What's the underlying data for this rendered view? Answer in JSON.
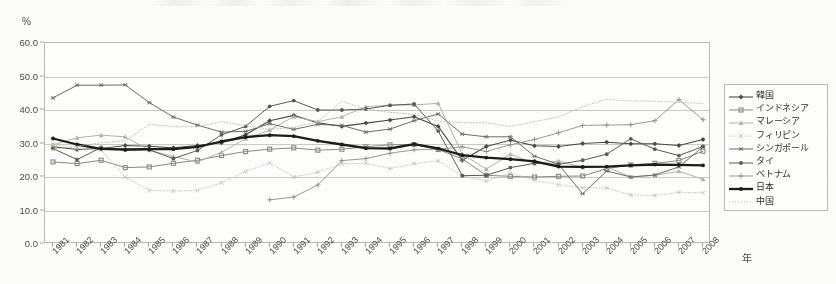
{
  "unit_label": "%",
  "xaxis_title": "年",
  "legend": {
    "items": [
      {
        "label": "韓国",
        "color": "#4a4a46",
        "marker": "diamond",
        "dash": "none",
        "width": 1.1
      },
      {
        "label": "インドネシア",
        "color": "#8a8a82",
        "marker": "square",
        "dash": "none",
        "width": 1.0
      },
      {
        "label": "マレーシア",
        "color": "#b4b4aa",
        "marker": "triangle",
        "dash": "none",
        "width": 1.0
      },
      {
        "label": "フィリピン",
        "color": "#c2c2b6",
        "marker": "x",
        "dash": "1,2",
        "width": 0.9
      },
      {
        "label": "シンガポール",
        "color": "#6f6f68",
        "marker": "asterisk",
        "dash": "none",
        "width": 1.0
      },
      {
        "label": "タイ",
        "color": "#5b5b55",
        "marker": "dot",
        "dash": "none",
        "width": 1.0
      },
      {
        "label": "ベトナム",
        "color": "#8f8f87",
        "marker": "plus",
        "dash": "none",
        "width": 0.9
      },
      {
        "label": "日本",
        "color": "#1c1c1a",
        "marker": "dot",
        "dash": "none",
        "width": 2.3
      },
      {
        "label": "中国",
        "color": "#b8b8ad",
        "marker": "none",
        "dash": "1,2",
        "width": 0.9
      }
    ]
  },
  "chart_data": {
    "type": "line",
    "title": "",
    "xlabel": "年",
    "ylabel": "%",
    "ylim": [
      0.0,
      60.0
    ],
    "yticks": [
      "0.0",
      "10.0",
      "20.0",
      "30.0",
      "40.0",
      "50.0",
      "60.0"
    ],
    "grid": true,
    "legend_position": "right",
    "x": [
      1981,
      1982,
      1983,
      1984,
      1985,
      1986,
      1987,
      1988,
      1989,
      1990,
      1991,
      1992,
      1993,
      1994,
      1995,
      1996,
      1997,
      1998,
      1999,
      2000,
      2001,
      2002,
      2003,
      2004,
      2005,
      2006,
      2007,
      2008
    ],
    "categories": [
      "1981",
      "1982",
      "1983",
      "1984",
      "1985",
      "1986",
      "1987",
      "1988",
      "1989",
      "1990",
      "1991",
      "1992",
      "1993",
      "1994",
      "1995",
      "1996",
      "1997",
      "1998",
      "1999",
      "2000",
      "2001",
      "2002",
      "2003",
      "2004",
      "2005",
      "2006",
      "2007",
      "2008"
    ],
    "series": [
      {
        "name": "韓国",
        "values": [
          29.0,
          28.2,
          28.5,
          29.4,
          29.2,
          28.7,
          29.4,
          30.2,
          32.6,
          36.8,
          38.4,
          36.2,
          35.1,
          36.1,
          37.0,
          38.0,
          35.1,
          25.0,
          29.1,
          31.0,
          29.3,
          29.1,
          30.0,
          30.4,
          29.9,
          29.9,
          29.4,
          31.2
        ]
      },
      {
        "name": "インドネシア",
        "values": [
          24.5,
          24.0,
          25.0,
          22.8,
          23.0,
          24.1,
          25.0,
          26.4,
          27.6,
          28.3,
          28.7,
          28.0,
          28.3,
          29.0,
          29.6,
          29.7,
          28.2,
          25.4,
          20.5,
          20.2,
          20.0,
          20.2,
          20.3,
          22.5,
          23.6,
          24.1,
          24.9,
          27.7
        ]
      },
      {
        "name": "マレーシア",
        "values": [
          29.6,
          31.7,
          32.5,
          32.0,
          28.0,
          26.1,
          24.5,
          27.4,
          31.4,
          34.0,
          38.0,
          36.5,
          38.0,
          41.0,
          41.5,
          41.5,
          42.0,
          26.8,
          22.4,
          26.8,
          24.0,
          24.8,
          22.8,
          23.0,
          20.0,
          20.5,
          21.7,
          19.3
        ]
      },
      {
        "name": "フィリピン",
        "values": [
          29.6,
          28.5,
          28.0,
          20.0,
          16.0,
          15.8,
          16.0,
          18.3,
          21.6,
          24.2,
          20.0,
          21.4,
          23.9,
          24.1,
          22.5,
          24.0,
          24.8,
          20.3,
          18.8,
          21.2,
          19.0,
          17.7,
          16.8,
          16.7,
          14.6,
          14.5,
          15.4,
          15.3
        ]
      },
      {
        "name": "シンガポール",
        "values": [
          43.6,
          47.4,
          47.4,
          47.5,
          42.2,
          37.9,
          35.5,
          33.4,
          33.6,
          35.9,
          34.2,
          35.7,
          35.4,
          33.4,
          34.3,
          36.8,
          38.8,
          32.8,
          32.0,
          32.0,
          26.2,
          23.8,
          15.0,
          21.8,
          20.0,
          20.6,
          23.0,
          29.0
        ]
      },
      {
        "name": "タイ",
        "values": [
          28.5,
          25.2,
          28.8,
          28.0,
          28.1,
          25.5,
          27.9,
          32.6,
          35.1,
          41.1,
          42.8,
          40.0,
          40.0,
          40.3,
          41.4,
          41.8,
          33.7,
          20.4,
          20.5,
          22.8,
          24.1,
          23.8,
          25.0,
          26.8,
          31.4,
          28.3,
          26.4,
          29.1
        ]
      },
      {
        "name": "ベトナム",
        "values": [
          null,
          null,
          null,
          null,
          null,
          null,
          null,
          null,
          null,
          13.2,
          14.0,
          17.6,
          24.9,
          25.5,
          27.1,
          28.1,
          28.3,
          29.0,
          27.6,
          29.6,
          31.2,
          33.2,
          35.4,
          35.5,
          35.6,
          36.8,
          43.1,
          37.1
        ]
      },
      {
        "name": "日本",
        "values": [
          31.5,
          29.7,
          28.4,
          28.2,
          28.3,
          28.3,
          29.0,
          30.6,
          31.9,
          32.5,
          32.2,
          30.8,
          29.7,
          28.6,
          28.5,
          29.8,
          28.5,
          26.5,
          25.8,
          25.3,
          24.7,
          23.1,
          23.0,
          23.1,
          23.5,
          23.7,
          23.6,
          23.5
        ]
      },
      {
        "name": "中国",
        "values": [
          28.3,
          29.2,
          30.2,
          30.8,
          35.7,
          35.0,
          35.0,
          36.5,
          35.3,
          34.2,
          34.8,
          36.5,
          42.6,
          40.2,
          39.3,
          38.7,
          36.7,
          36.2,
          36.2,
          35.1,
          36.5,
          37.9,
          41.0,
          43.2,
          42.7,
          42.6,
          42.3,
          42.0
        ]
      }
    ]
  }
}
